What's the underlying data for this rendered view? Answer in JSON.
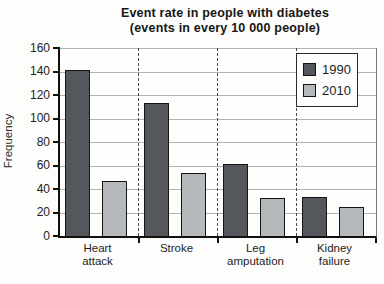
{
  "title": {
    "line1": "Event rate in people with diabetes",
    "line2": "(events in every 10 000 people)"
  },
  "chart_data": {
    "type": "bar",
    "title": "Event rate in people with diabetes (events in every 10 000 people)",
    "categories": [
      "Heart attack",
      "Stroke",
      "Leg amputation",
      "Kidney failure"
    ],
    "category_label_lines": [
      [
        "Heart",
        "attack"
      ],
      [
        "Stroke"
      ],
      [
        "Leg",
        "amputation"
      ],
      [
        "Kidney",
        "failure"
      ]
    ],
    "series": [
      {
        "name": "1990",
        "color": "#54575b",
        "values": [
          141,
          113,
          61,
          33
        ]
      },
      {
        "name": "2010",
        "color": "#b5b9bb",
        "values": [
          47,
          54,
          32,
          25
        ]
      }
    ],
    "xlabel": "",
    "ylabel": "Frequency",
    "ylim": [
      0,
      160
    ],
    "yticks": [
      0,
      20,
      40,
      60,
      80,
      100,
      120,
      140,
      160
    ],
    "grid": "horizontal solid gridlines; dashed vertical category separators",
    "legend_position": "top-right inside plot"
  },
  "colors": {
    "series_1990": "#54575b",
    "series_2010": "#b5b9bb",
    "gridline": "#b3b3b3",
    "axis": "#111111",
    "background": "#fdfdfb"
  }
}
